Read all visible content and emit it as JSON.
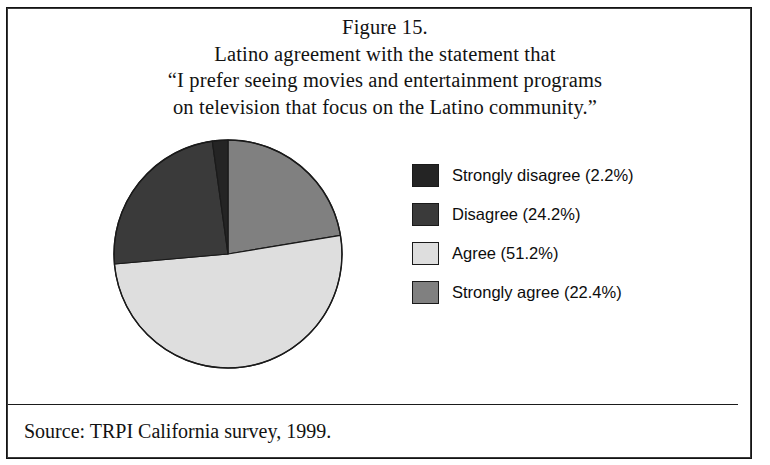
{
  "figure": {
    "title_lines": [
      "Figure 15.",
      "Latino agreement with the statement that",
      "“I prefer seeing movies and entertainment programs",
      "on television that focus on the Latino community.”"
    ],
    "source_note": "Source: TRPI California survey, 1999."
  },
  "chart_data": {
    "type": "pie",
    "title": "Figure 15. Latino agreement with the statement that “I prefer seeing movies and entertainment programs on television that focus on the Latino community.”",
    "xlabel": "",
    "ylabel": "",
    "legend_position": "right",
    "grid": false,
    "start_angle_deg": 0,
    "direction": "clockwise",
    "units": "percent",
    "categories": [
      "Strongly disagree",
      "Disagree",
      "Agree",
      "Strongly agree"
    ],
    "values": [
      2.2,
      24.2,
      51.2,
      22.4
    ],
    "labels": [
      "Strongly disagree (2.2%)",
      "Disagree (24.2%)",
      "Agree (51.2%)",
      "Strongly agree (22.4%)"
    ],
    "colors": [
      "#242424",
      "#3a3a3a",
      "#dedede",
      "#808080"
    ],
    "slice_draw_order": [
      {
        "name": "Strongly agree",
        "value": 22.4,
        "color": "#808080",
        "start_deg": 0.0,
        "end_deg": 80.64
      },
      {
        "name": "Agree",
        "value": 51.2,
        "color": "#dedede",
        "start_deg": 80.64,
        "end_deg": 264.96
      },
      {
        "name": "Disagree",
        "value": 24.2,
        "color": "#3a3a3a",
        "start_deg": 264.96,
        "end_deg": 352.08
      },
      {
        "name": "Strongly disagree",
        "value": 2.2,
        "color": "#242424",
        "start_deg": 352.08,
        "end_deg": 360.0
      }
    ]
  },
  "legend": {
    "items": [
      {
        "label": "Strongly disagree (2.2%)",
        "swatch": "#242424"
      },
      {
        "label": "Disagree (24.2%)",
        "swatch": "#3a3a3a"
      },
      {
        "label": "Agree (51.2%)",
        "swatch": "#dedede"
      },
      {
        "label": "Strongly agree (22.4%)",
        "swatch": "#808080"
      }
    ]
  },
  "colors": {
    "frame": "#141414",
    "background": "#ffffff",
    "text": "#121212",
    "slice_outline": "#1a1a1a"
  }
}
